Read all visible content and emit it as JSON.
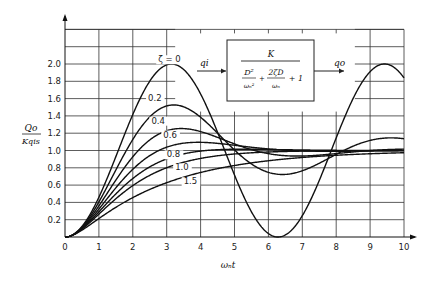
{
  "chart_data": {
    "type": "line",
    "title": "",
    "xlabel": "ωₙt",
    "ylabel_num": "Qo",
    "ylabel_den": "Kqis",
    "xlim": [
      0,
      10
    ],
    "ylim": [
      0,
      2.4
    ],
    "grid": true,
    "x_ticks": [
      "0",
      "1",
      "2",
      "3",
      "4",
      "5",
      "6",
      "7",
      "8",
      "9",
      "10"
    ],
    "y_ticks": [
      "0.2",
      "0.4",
      "0.6",
      "0.8",
      "1.0",
      "1.2",
      "1.4",
      "1.6",
      "1.8",
      "2.0"
    ],
    "series": [
      {
        "name": "ζ = 0",
        "zeta": 0.0,
        "label": "ζ  =  0",
        "label_pos": [
          2.75,
          2.02
        ],
        "peak": [
          3.14,
          2.0
        ],
        "min": [
          6.28,
          0.0
        ]
      },
      {
        "name": "0.2",
        "zeta": 0.2,
        "label": "0.2",
        "label_pos": [
          2.45,
          1.57
        ],
        "peak": [
          3.2,
          1.53
        ]
      },
      {
        "name": "0.4",
        "zeta": 0.4,
        "label": "0.4",
        "label_pos": [
          2.55,
          1.31
        ],
        "peak": [
          3.4,
          1.25
        ]
      },
      {
        "name": "0.6",
        "zeta": 0.6,
        "label": "0.6",
        "label_pos": [
          2.9,
          1.15
        ],
        "peak": [
          3.9,
          1.09
        ]
      },
      {
        "name": "0.8",
        "zeta": 0.8,
        "label": "0.8",
        "label_pos": [
          3.0,
          0.92
        ],
        "peak": [
          5.2,
          1.02
        ]
      },
      {
        "name": "1.0",
        "zeta": 1.0,
        "label": "1.0",
        "label_pos": [
          3.25,
          0.77
        ]
      },
      {
        "name": "1.5",
        "zeta": 1.5,
        "label": "1.5",
        "label_pos": [
          3.5,
          0.61
        ]
      }
    ]
  },
  "block_diagram": {
    "input": "qi",
    "output": "qo",
    "numerator": "K",
    "den_term1_num": "D²",
    "den_term1_den": "ωₙ²",
    "plus1": "+",
    "den_term2_num": "2ζD",
    "den_term2_den": "ωₙ",
    "plus2": "+ 1"
  }
}
